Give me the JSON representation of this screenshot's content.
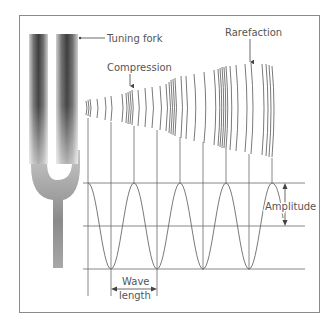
{
  "labels": {
    "tuning_fork": "Tuning fork",
    "compression": "Compression",
    "rarefaction": "Rarefaction",
    "amplitude": "Amplitude",
    "wavelength_line1": "Wave",
    "wavelength_line2": "length"
  },
  "colors": {
    "frame": "#8a8a8a",
    "line": "#6a6a6a",
    "fork_dark": "#3a3a3a",
    "fork_light": "#d8d8d8",
    "text": "#555555"
  }
}
